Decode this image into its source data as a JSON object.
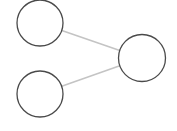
{
  "diagram": {
    "type": "graph",
    "background": "#ffffff",
    "node_stroke": "#4a4a4a",
    "edge_stroke": "#c4c4c4",
    "nodes": [
      {
        "id": "n1",
        "label": "",
        "cx": 40,
        "cy": 23,
        "r": 23
      },
      {
        "id": "n2",
        "label": "",
        "cx": 40,
        "cy": 94,
        "r": 23
      },
      {
        "id": "n3",
        "label": "",
        "cx": 142,
        "cy": 58,
        "r": 23.5
      }
    ],
    "edges": [
      {
        "from": "n1",
        "to": "n3"
      },
      {
        "from": "n2",
        "to": "n3"
      }
    ]
  }
}
